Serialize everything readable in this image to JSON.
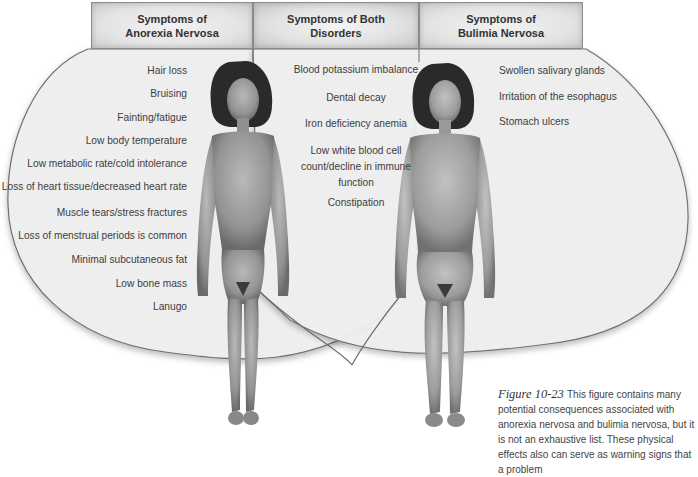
{
  "headers": {
    "anorexia": [
      "Symptoms of",
      "Anorexia Nervosa"
    ],
    "both": [
      "Symptoms of Both",
      "Disorders"
    ],
    "bulimia": [
      "Symptoms of",
      "Bulimia Nervosa"
    ]
  },
  "anorexia_symptoms": [
    "Hair loss",
    "Bruising",
    "Fainting/fatigue",
    "Low body temperature",
    "Low metabolic rate/cold intolerance",
    "Loss of heart tissue/decreased heart rate",
    "Muscle tears/stress fractures",
    "Loss of menstrual periods is common",
    "Minimal subcutaneous fat",
    "Low bone mass",
    "Lanugo"
  ],
  "both_symptoms": [
    "Blood potassium imbalance",
    "Dental decay",
    "Iron deficiency anemia",
    "Low white blood cell count/decline in immune function",
    "Constipation"
  ],
  "bulimia_symptoms": [
    "Swollen salivary glands",
    "Irritation of the esophagus",
    "Stomach ulcers"
  ],
  "caption": {
    "label": "Figure 10-23",
    "text": "This figure contains many potential consequences associated with anorexia nervosa and bulimia nervosa, but it is not an exhaustive list. These physical effects also can serve as warning signs that a problem"
  },
  "figures": {
    "left": "anorexia-body-illustration",
    "right": "bulimia-body-illustration"
  },
  "colors": {
    "venn_fill": "#efefef",
    "venn_stroke": "#6e6e6e",
    "header_border": "#8a8a8a",
    "text": "#3d3d3d",
    "skin": "#9a9a9a"
  }
}
